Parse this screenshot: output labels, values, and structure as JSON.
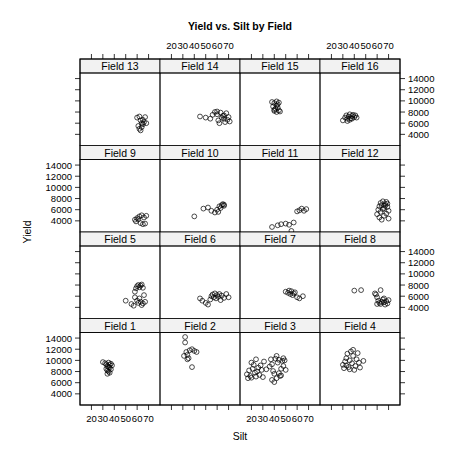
{
  "chart_data": {
    "type": "scatter",
    "title": "Yield vs. Silt by Field",
    "xlabel": "Silt",
    "ylabel": "Yield",
    "xlim": [
      10,
      80
    ],
    "ylim": [
      2000,
      15000
    ],
    "x_ticks": [
      20,
      30,
      40,
      50,
      60,
      70
    ],
    "y_ticks": [
      4000,
      6000,
      8000,
      10000,
      12000,
      14000
    ],
    "layout": {
      "columns": 4,
      "rows": 4,
      "strip_fill": "#f2f2f2",
      "point_color": "#000000",
      "point_shape": "open-circle"
    },
    "panels": [
      {
        "name": "Field 13",
        "row": 0,
        "col": 0,
        "points": [
          [
            60,
            7000
          ],
          [
            62,
            7200
          ],
          [
            63,
            6500
          ],
          [
            64,
            6000
          ],
          [
            65,
            5800
          ],
          [
            66,
            6200
          ],
          [
            67,
            7100
          ],
          [
            68,
            6000
          ],
          [
            61,
            5500
          ],
          [
            62,
            5000
          ],
          [
            63,
            4700
          ],
          [
            64,
            5300
          ],
          [
            65,
            6600
          ]
        ]
      },
      {
        "name": "Field 14",
        "row": 0,
        "col": 1,
        "points": [
          [
            45,
            7200
          ],
          [
            50,
            7000
          ],
          [
            54,
            6800
          ],
          [
            56,
            7500
          ],
          [
            58,
            8000
          ],
          [
            60,
            7600
          ],
          [
            61,
            6500
          ],
          [
            62,
            6000
          ],
          [
            64,
            7000
          ],
          [
            65,
            7300
          ],
          [
            66,
            6800
          ],
          [
            67,
            6200
          ],
          [
            68,
            7800
          ],
          [
            69,
            6600
          ],
          [
            70,
            7100
          ],
          [
            71,
            6300
          ],
          [
            60,
            8100
          ],
          [
            63,
            7900
          ],
          [
            66,
            7400
          ]
        ]
      },
      {
        "name": "Field 15",
        "row": 0,
        "col": 2,
        "points": [
          [
            38,
            9800
          ],
          [
            40,
            9600
          ],
          [
            42,
            9200
          ],
          [
            43,
            8800
          ],
          [
            40,
            8400
          ],
          [
            42,
            8000
          ],
          [
            44,
            8300
          ],
          [
            41,
            8600
          ],
          [
            39,
            9000
          ],
          [
            43,
            9400
          ],
          [
            45,
            8100
          ],
          [
            40,
            8200
          ],
          [
            42,
            9900
          ],
          [
            44,
            9700
          ]
        ]
      },
      {
        "name": "Field 16",
        "row": 0,
        "col": 3,
        "points": [
          [
            30,
            6500
          ],
          [
            32,
            7000
          ],
          [
            33,
            7400
          ],
          [
            34,
            6800
          ],
          [
            35,
            7200
          ],
          [
            36,
            7600
          ],
          [
            37,
            6900
          ],
          [
            38,
            7300
          ],
          [
            39,
            7500
          ],
          [
            40,
            7100
          ],
          [
            41,
            7400
          ],
          [
            42,
            7000
          ],
          [
            34,
            6400
          ],
          [
            36,
            6600
          ],
          [
            38,
            6800
          ]
        ]
      },
      {
        "name": "Field 9",
        "row": 1,
        "col": 0,
        "points": [
          [
            58,
            4200
          ],
          [
            60,
            4500
          ],
          [
            62,
            4800
          ],
          [
            64,
            5000
          ],
          [
            66,
            4600
          ],
          [
            68,
            4900
          ],
          [
            63,
            3600
          ],
          [
            65,
            3400
          ],
          [
            67,
            3500
          ],
          [
            59,
            3900
          ],
          [
            61,
            4300
          ]
        ]
      },
      {
        "name": "Field 10",
        "row": 1,
        "col": 1,
        "points": [
          [
            40,
            4800
          ],
          [
            48,
            6200
          ],
          [
            52,
            6400
          ],
          [
            55,
            5800
          ],
          [
            58,
            5500
          ],
          [
            60,
            6000
          ],
          [
            62,
            6600
          ],
          [
            64,
            6800
          ],
          [
            65,
            7000
          ],
          [
            66,
            6900
          ],
          [
            63,
            6300
          ],
          [
            61,
            5600
          ],
          [
            66,
            6700
          ]
        ]
      },
      {
        "name": "Field 11",
        "row": 1,
        "col": 2,
        "points": [
          [
            38,
            2900
          ],
          [
            43,
            3200
          ],
          [
            46,
            3400
          ],
          [
            50,
            3500
          ],
          [
            53,
            3300
          ],
          [
            55,
            2200
          ],
          [
            57,
            3700
          ],
          [
            60,
            5700
          ],
          [
            62,
            5900
          ],
          [
            64,
            6200
          ],
          [
            66,
            5800
          ],
          [
            68,
            6100
          ]
        ]
      },
      {
        "name": "Field 12",
        "row": 1,
        "col": 3,
        "points": [
          [
            60,
            5200
          ],
          [
            61,
            6000
          ],
          [
            62,
            6600
          ],
          [
            63,
            7200
          ],
          [
            64,
            6800
          ],
          [
            65,
            7500
          ],
          [
            66,
            6300
          ],
          [
            67,
            7000
          ],
          [
            68,
            7400
          ],
          [
            69,
            6500
          ],
          [
            70,
            5800
          ],
          [
            62,
            4600
          ],
          [
            64,
            4200
          ],
          [
            66,
            4900
          ],
          [
            68,
            5300
          ],
          [
            70,
            4400
          ],
          [
            63,
            5600
          ],
          [
            65,
            6100
          ],
          [
            67,
            6700
          ],
          [
            69,
            7100
          ]
        ]
      },
      {
        "name": "Field 5",
        "row": 2,
        "col": 0,
        "points": [
          [
            50,
            5200
          ],
          [
            55,
            4600
          ],
          [
            57,
            4300
          ],
          [
            58,
            6800
          ],
          [
            59,
            7400
          ],
          [
            60,
            7800
          ],
          [
            61,
            8000
          ],
          [
            62,
            7600
          ],
          [
            63,
            7900
          ],
          [
            64,
            8100
          ],
          [
            65,
            7500
          ],
          [
            58,
            5800
          ],
          [
            60,
            5200
          ],
          [
            61,
            4800
          ],
          [
            62,
            5600
          ],
          [
            63,
            5000
          ],
          [
            64,
            4400
          ],
          [
            65,
            4700
          ],
          [
            66,
            6200
          ],
          [
            67,
            5000
          ]
        ]
      },
      {
        "name": "Field 6",
        "row": 2,
        "col": 1,
        "points": [
          [
            45,
            5600
          ],
          [
            47,
            5200
          ],
          [
            50,
            4800
          ],
          [
            52,
            4500
          ],
          [
            54,
            5400
          ],
          [
            55,
            6000
          ],
          [
            56,
            6300
          ],
          [
            57,
            5800
          ],
          [
            58,
            6500
          ],
          [
            59,
            5600
          ],
          [
            60,
            6200
          ],
          [
            61,
            5900
          ],
          [
            62,
            6400
          ],
          [
            63,
            5300
          ],
          [
            64,
            6100
          ],
          [
            66,
            5700
          ],
          [
            68,
            6400
          ],
          [
            70,
            5800
          ]
        ]
      },
      {
        "name": "Field 7",
        "row": 2,
        "col": 2,
        "points": [
          [
            50,
            6800
          ],
          [
            52,
            6600
          ],
          [
            53,
            7000
          ],
          [
            54,
            6400
          ],
          [
            55,
            6900
          ],
          [
            56,
            6200
          ],
          [
            57,
            6500
          ],
          [
            58,
            6700
          ],
          [
            60,
            5800
          ],
          [
            62,
            5600
          ],
          [
            65,
            6000
          ]
        ]
      },
      {
        "name": "Field 8",
        "row": 2,
        "col": 3,
        "points": [
          [
            40,
            7000
          ],
          [
            46,
            7100
          ],
          [
            58,
            6500
          ],
          [
            59,
            6300
          ],
          [
            60,
            5800
          ],
          [
            61,
            5200
          ],
          [
            62,
            4800
          ],
          [
            63,
            4600
          ],
          [
            64,
            5000
          ],
          [
            65,
            5400
          ],
          [
            66,
            4900
          ],
          [
            67,
            4500
          ],
          [
            68,
            5100
          ],
          [
            69,
            4700
          ],
          [
            70,
            5300
          ],
          [
            63,
            7100
          ],
          [
            66,
            5600
          ],
          [
            60,
            4600
          ]
        ]
      },
      {
        "name": "Field 1",
        "row": 3,
        "col": 0,
        "points": [
          [
            30,
            9700
          ],
          [
            32,
            9500
          ],
          [
            33,
            9300
          ],
          [
            34,
            9000
          ],
          [
            35,
            8800
          ],
          [
            36,
            9200
          ],
          [
            37,
            9400
          ],
          [
            33,
            8500
          ],
          [
            34,
            8200
          ],
          [
            35,
            8000
          ],
          [
            36,
            7800
          ],
          [
            37,
            8400
          ],
          [
            34,
            7600
          ],
          [
            36,
            8700
          ],
          [
            38,
            9100
          ],
          [
            35,
            9600
          ]
        ]
      },
      {
        "name": "Field 2",
        "row": 3,
        "col": 1,
        "points": [
          [
            32,
            14200
          ],
          [
            32,
            13200
          ],
          [
            33,
            11500
          ],
          [
            34,
            11000
          ],
          [
            35,
            10400
          ],
          [
            36,
            11800
          ],
          [
            38,
            12000
          ],
          [
            40,
            11700
          ],
          [
            42,
            11500
          ],
          [
            38,
            8800
          ],
          [
            31,
            10800
          ],
          [
            34,
            10200
          ]
        ]
      },
      {
        "name": "Field 3",
        "row": 3,
        "col": 2,
        "points": [
          [
            16,
            7500
          ],
          [
            17,
            6800
          ],
          [
            18,
            8200
          ],
          [
            19,
            7200
          ],
          [
            20,
            6900
          ],
          [
            21,
            8500
          ],
          [
            22,
            9200
          ],
          [
            23,
            7800
          ],
          [
            24,
            7100
          ],
          [
            25,
            8000
          ],
          [
            26,
            8700
          ],
          [
            27,
            7400
          ],
          [
            28,
            9100
          ],
          [
            29,
            8300
          ],
          [
            30,
            7000
          ],
          [
            31,
            9800
          ],
          [
            33,
            8400
          ],
          [
            36,
            8900
          ],
          [
            37,
            10200
          ],
          [
            38,
            9300
          ],
          [
            39,
            8100
          ],
          [
            40,
            7600
          ],
          [
            41,
            10300
          ],
          [
            42,
            10800
          ],
          [
            43,
            9600
          ],
          [
            44,
            10100
          ],
          [
            45,
            7200
          ],
          [
            46,
            8500
          ],
          [
            47,
            9900
          ],
          [
            48,
            10400
          ],
          [
            38,
            6500
          ],
          [
            40,
            6100
          ],
          [
            42,
            6800
          ],
          [
            44,
            7700
          ],
          [
            46,
            7300
          ],
          [
            48,
            9000
          ],
          [
            49,
            10000
          ],
          [
            50,
            8300
          ],
          [
            20,
            9600
          ],
          [
            24,
            10200
          ]
        ]
      },
      {
        "name": "Field 4",
        "row": 3,
        "col": 3,
        "points": [
          [
            30,
            9200
          ],
          [
            31,
            8600
          ],
          [
            32,
            9800
          ],
          [
            33,
            10400
          ],
          [
            34,
            11200
          ],
          [
            35,
            8800
          ],
          [
            36,
            10000
          ],
          [
            37,
            11600
          ],
          [
            38,
            9500
          ],
          [
            39,
            10800
          ],
          [
            40,
            8300
          ],
          [
            41,
            9000
          ],
          [
            42,
            10200
          ],
          [
            43,
            11300
          ],
          [
            44,
            9600
          ],
          [
            45,
            8700
          ],
          [
            48,
            9900
          ],
          [
            33,
            9100
          ],
          [
            36,
            8400
          ],
          [
            39,
            11900
          ]
        ]
      }
    ],
    "axis_placement": {
      "x_top_labels_cols": [
        1,
        3
      ],
      "x_bottom_labels_cols": [
        0,
        2
      ],
      "y_left_labels_rows": [
        1,
        3
      ],
      "y_right_labels_rows": [
        0,
        2
      ]
    }
  }
}
